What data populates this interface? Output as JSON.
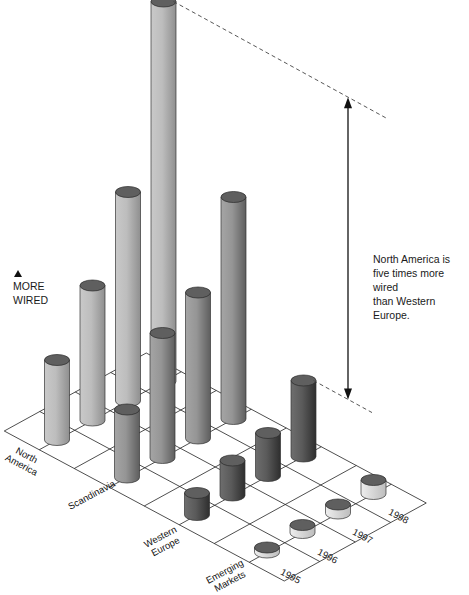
{
  "chart_data": {
    "type": "bar",
    "subtype": "3d-cylinder-isometric",
    "title": "",
    "categories": [
      "1995",
      "1996",
      "1997",
      "1998"
    ],
    "series": [
      {
        "name": "North America",
        "values": [
          80,
          135,
          209,
          380
        ],
        "color": "#b9b9b9"
      },
      {
        "name": "Scandinavia",
        "values": [
          68,
          125,
          146,
          222
        ],
        "color": "#8e8e8e"
      },
      {
        "name": "Western Europe",
        "values": [
          22,
          35,
          43,
          76
        ],
        "color": "#5a5a5a"
      },
      {
        "name": "Emerging Markets",
        "values": [
          5,
          8,
          9,
          14
        ],
        "color": "#5a5a5a"
      }
    ],
    "units": "relative (no axis scale shown)",
    "xlabel": "Year",
    "ylabel": "More wired",
    "grid": true,
    "legend": "none (rows labeled directly)",
    "annotations": [
      "North America is five times more wired than Western Europe."
    ]
  },
  "labels": {
    "y_axis_line1": "MORE",
    "y_axis_line2": "WIRED",
    "regions": [
      {
        "line1": "North",
        "line2": "America"
      },
      {
        "line1": "Scandinavia",
        "line2": ""
      },
      {
        "line1": "Western",
        "line2": "Europe"
      },
      {
        "line1": "Emerging",
        "line2": "Markets"
      }
    ],
    "years": [
      "1995",
      "1996",
      "1997",
      "1998"
    ],
    "annotation_line1": "North America is",
    "annotation_line2": "five times more wired",
    "annotation_line3": "than Western Europe."
  }
}
